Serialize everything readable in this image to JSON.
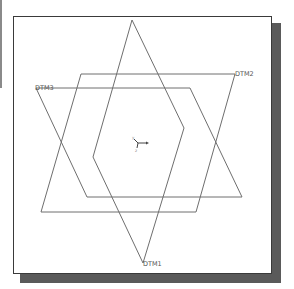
{
  "diagram": {
    "title": "",
    "type": "datum-planes-isometric-view",
    "colors": {
      "background": "#ffffff",
      "frame_border": "#3a3a3a",
      "shadow": "#5a5a5a",
      "plane_lines": "#6e6e6e",
      "labels": "#555555"
    },
    "datum_planes": [
      {
        "name": "DTM1",
        "label": "DTM1",
        "points": "132,20 184,128 143,263 93,157",
        "label_x": 143,
        "label_y": 265
      },
      {
        "name": "DTM2",
        "label": "DTM2",
        "points": "81,74 235,74 196,212 41,212",
        "label_x": 235,
        "label_y": 76
      },
      {
        "name": "DTM3",
        "label": "DTM3",
        "points": "36,88 190,88 242,197 87,197",
        "label_x": 35,
        "label_y": 90
      }
    ],
    "coordinate_system": {
      "label": "csys-indicator",
      "x_axis_label": "x",
      "y_axis_label": "y",
      "z_axis_label": "z"
    }
  }
}
